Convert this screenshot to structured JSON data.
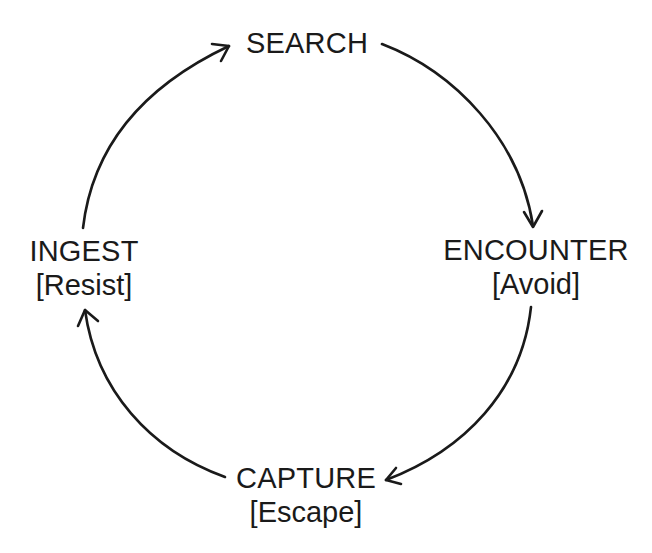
{
  "diagram": {
    "type": "cycle",
    "direction": "clockwise",
    "stroke_color": "#1a1a1a",
    "background_color": "#ffffff",
    "nodes": [
      {
        "id": "search",
        "name": "SEARCH",
        "action": ""
      },
      {
        "id": "encounter",
        "name": "ENCOUNTER",
        "action": "[Avoid]"
      },
      {
        "id": "capture",
        "name": "CAPTURE",
        "action": "[Escape]"
      },
      {
        "id": "ingest",
        "name": "INGEST",
        "action": "[Resist]"
      }
    ],
    "edges": [
      {
        "from": "search",
        "to": "encounter"
      },
      {
        "from": "encounter",
        "to": "capture"
      },
      {
        "from": "capture",
        "to": "ingest"
      },
      {
        "from": "ingest",
        "to": "search"
      }
    ]
  }
}
